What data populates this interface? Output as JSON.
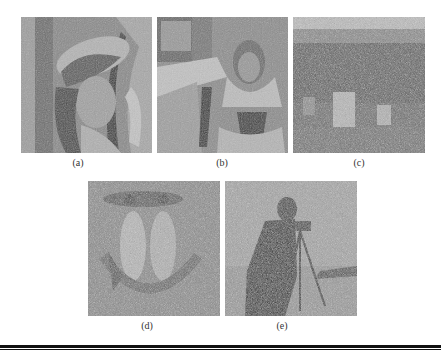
{
  "figure": {
    "panels": [
      {
        "id": "a",
        "label": "(a)",
        "subject": "woman-with-hat-noisy-image",
        "noise": "light"
      },
      {
        "id": "b",
        "label": "(b)",
        "subject": "woman-with-scarf-noisy-image",
        "noise": "light"
      },
      {
        "id": "c",
        "label": "(c)",
        "subject": "village-houses-noisy-image",
        "noise": "heavy"
      },
      {
        "id": "d",
        "label": "(d)",
        "subject": "baboon-noisy-image",
        "noise": "heavy"
      },
      {
        "id": "e",
        "label": "(e)",
        "subject": "cameraman-noisy-image",
        "noise": "heavy"
      }
    ]
  }
}
